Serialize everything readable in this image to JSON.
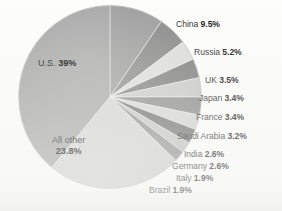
{
  "chart_data": {
    "type": "pie",
    "title": "",
    "subtitle": "",
    "legend_position": "outside-right",
    "grid": false,
    "units": "percent",
    "start_angle_deg": 0,
    "direction": "clockwise",
    "categories": [
      "China",
      "Russia",
      "UK",
      "Japan",
      "France",
      "Saudi Arabia",
      "India",
      "Germany",
      "Italy",
      "Brazil",
      "All other",
      "U.S."
    ],
    "values": [
      9.5,
      5.2,
      3.5,
      3.4,
      3.4,
      3.2,
      2.6,
      2.6,
      1.9,
      1.9,
      23.8,
      39
    ],
    "labels": [
      "China 9.5%",
      "Russia 5.2%",
      "UK 3.5%",
      "Japan 3.4%",
      "France 3.4%",
      "Saudi Arabia 3.2%",
      "India 2.6%",
      "Germany 2.6%",
      "Italy 1.9%",
      "Brazil 1.9%",
      "All other 23.8%",
      "U.S. 39%"
    ],
    "slice_colors": [
      "#9a9a9a",
      "#878787",
      "#dcdcdc",
      "#7e7e7e",
      "#c9c9c9",
      "#8b8b8b",
      "#d6d6d6",
      "#707070",
      "#c4c4c4",
      "#8f8f8f",
      "#d3d3d3",
      "#a3a3a3"
    ],
    "xlabel": "",
    "ylabel": ""
  },
  "slices": [
    {
      "name": "China",
      "pct_text": "9.5%",
      "label_name": "China",
      "color": "#9a9a9a"
    },
    {
      "name": "Russia",
      "pct_text": "5.2%",
      "label_name": "Russia",
      "color": "#878787"
    },
    {
      "name": "UK",
      "pct_text": "3.5%",
      "label_name": "UK",
      "color": "#dcdcdc"
    },
    {
      "name": "Japan",
      "pct_text": "3.4%",
      "label_name": "Japan",
      "color": "#7e7e7e"
    },
    {
      "name": "France",
      "pct_text": "3.4%",
      "label_name": "France",
      "color": "#c9c9c9"
    },
    {
      "name": "Saudi Arabia",
      "pct_text": "3.2%",
      "label_name": "Saudi Arabia",
      "color": "#8b8b8b"
    },
    {
      "name": "India",
      "pct_text": "2.6%",
      "label_name": "India",
      "color": "#d6d6d6"
    },
    {
      "name": "Germany",
      "pct_text": "2.6%",
      "label_name": "Germany",
      "color": "#707070"
    },
    {
      "name": "Italy",
      "pct_text": "1.9%",
      "label_name": "Italy",
      "color": "#c4c4c4"
    },
    {
      "name": "Brazil",
      "pct_text": "1.9%",
      "label_name": "Brazil",
      "color": "#8f8f8f"
    },
    {
      "name": "All other",
      "pct_text": "23.8%",
      "label_name": "All other",
      "color": "#d3d3d3"
    },
    {
      "name": "U.S.",
      "pct_text": "39%",
      "label_name": "U.S.",
      "color": "#a3a3a3"
    }
  ]
}
